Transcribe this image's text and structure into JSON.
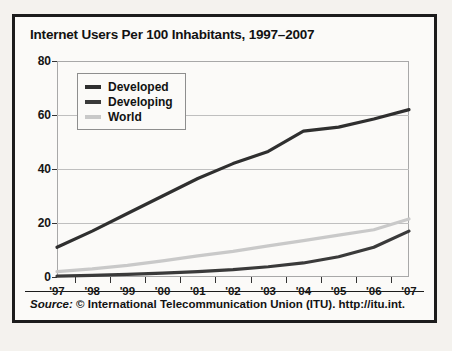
{
  "chart_data": {
    "type": "line",
    "title": "Internet Users Per 100 Inhabitants, 1997–2007",
    "xlabel": "",
    "ylabel": "",
    "ylim": [
      0,
      80
    ],
    "yticks": [
      0,
      20,
      40,
      60,
      80
    ],
    "grid": true,
    "legend_position": "top-left",
    "categories": [
      "'97",
      "'98",
      "'99",
      "'00",
      "'01",
      "'02",
      "'03",
      "'04",
      "'05",
      "'06",
      "'07"
    ],
    "series": [
      {
        "name": "Developed",
        "color": "#2f2f2f",
        "values": [
          11,
          17,
          23.5,
          30,
          36.5,
          42,
          46.5,
          54,
          55.5,
          58.5,
          62
        ]
      },
      {
        "name": "Developing",
        "color": "#3a3a3a",
        "values": [
          0.3,
          0.6,
          1,
          1.4,
          2,
          2.7,
          3.8,
          5.2,
          7.5,
          11,
          17
        ]
      },
      {
        "name": "World",
        "color": "#c9c9c9",
        "values": [
          2,
          3,
          4.3,
          6,
          7.8,
          9.5,
          11.5,
          13.5,
          15.5,
          17.5,
          21.5
        ]
      }
    ]
  },
  "footer": {
    "source_word": "Source:",
    "source_text": " © International Telecommunication Union (ITU). http://itu.int."
  },
  "colors": {
    "page_background": "#f4f2ee",
    "figure_background": "#fbfaf8",
    "figure_border": "#1c1c1c",
    "gridline": "#bfbfbf",
    "axis_text": "#151515"
  }
}
